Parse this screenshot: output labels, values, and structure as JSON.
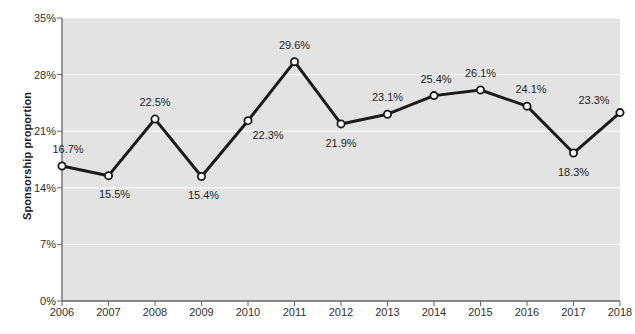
{
  "chart_data": {
    "type": "line",
    "title": "",
    "xlabel": "",
    "ylabel": "Sponsorship proportion",
    "categories": [
      "2006",
      "2007",
      "2008",
      "2009",
      "2010",
      "2011",
      "2012",
      "2013",
      "2014",
      "2015",
      "2016",
      "2017",
      "2018"
    ],
    "values": [
      16.7,
      15.5,
      22.5,
      15.4,
      22.3,
      29.6,
      21.9,
      23.1,
      25.4,
      26.1,
      24.1,
      18.3,
      23.3
    ],
    "point_labels": [
      "16.7%",
      "15.5%",
      "22.5%",
      "15.4%",
      "22.3%",
      "29.6%",
      "21.9%",
      "23.1%",
      "25.4%",
      "26.1%",
      "24.1%",
      "18.3%",
      "23.3%"
    ],
    "ylim": [
      0,
      35
    ],
    "yticks": [
      0,
      7,
      14,
      21,
      28,
      35
    ],
    "ytick_labels": [
      "0%",
      "7%",
      "14%",
      "21%",
      "28%",
      "35%"
    ],
    "grid": true,
    "legend": "none",
    "series_name": "Sponsorship proportion",
    "colors": {
      "line": "#1a1a1a",
      "marker_fill": "#ffffff",
      "marker_edge": "#1a1a1a",
      "plot_background": "#e3e3e3",
      "gridline": "#f7f7f7",
      "axis": "#666666",
      "text": "#232323"
    },
    "label_offsets": [
      {
        "dx": 6,
        "dy": -17
      },
      {
        "dx": 6,
        "dy": 18
      },
      {
        "dx": 0,
        "dy": -17
      },
      {
        "dx": 2,
        "dy": 19
      },
      {
        "dx": 20,
        "dy": 14
      },
      {
        "dx": 0,
        "dy": -17
      },
      {
        "dx": 0,
        "dy": 19
      },
      {
        "dx": 0,
        "dy": -17
      },
      {
        "dx": 2,
        "dy": -17
      },
      {
        "dx": 0,
        "dy": -17
      },
      {
        "dx": 4,
        "dy": -17
      },
      {
        "dx": 0,
        "dy": 19
      },
      {
        "dx": -26,
        "dy": -13
      }
    ]
  }
}
